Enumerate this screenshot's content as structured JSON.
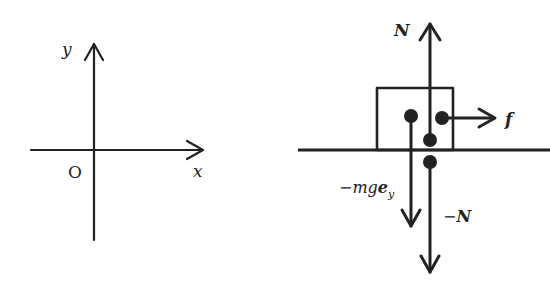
{
  "coordinate_axes": {
    "y_label": "y",
    "x_label": "x",
    "origin_label": "O"
  },
  "free_body_diagram": {
    "normal_force_label": "N",
    "friction_label": "f",
    "gravity_label_prefix": "−mg",
    "gravity_label_vector": "e",
    "gravity_label_subscript": "y",
    "reaction_label_prefix": "−",
    "reaction_label_vector": "N"
  },
  "colors": {
    "stroke": "#222222",
    "background": "#ffffff"
  }
}
